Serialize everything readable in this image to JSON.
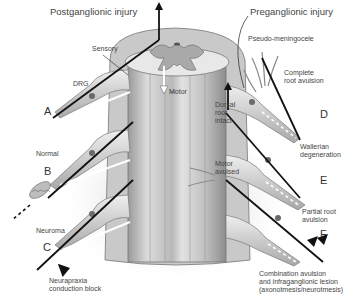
{
  "diagram": {
    "headings": {
      "left": "Postganglionic injury",
      "right": "Preganglionic injury"
    },
    "structure_labels": {
      "sensory": "Sensory",
      "drg": "DRG",
      "motor": "Motor",
      "pseudo_meningocele": "Pseudo-meningocele",
      "dorsal_root_intact": [
        "Dorsal",
        "root",
        "intact"
      ],
      "motor_avulsed": [
        "Motor",
        "avulsed"
      ]
    },
    "cases": [
      {
        "letter": "A",
        "side": "left",
        "description": [
          "Normal"
        ]
      },
      {
        "letter": "B",
        "side": "left",
        "description": [
          "Neuroma"
        ]
      },
      {
        "letter": "C",
        "side": "left",
        "description": [
          "Neurapraxia",
          "conduction block"
        ]
      },
      {
        "letter": "D",
        "side": "right",
        "description": [
          "Complete",
          "root avulsion"
        ]
      },
      {
        "letter": "E",
        "side": "right",
        "description": [
          "Wallerian",
          "degeneration"
        ]
      },
      {
        "letter": "F",
        "side": "right",
        "description": [
          "Partial root",
          "avulsion"
        ]
      }
    ],
    "footnote": [
      "Combination avulsion",
      "and infraganglionic lesion",
      "(axonotmesis/neurotmesis)"
    ],
    "icons": {
      "up-arrow": "↑",
      "arrowhead": "▶"
    },
    "colors": {
      "line": "#111111",
      "cord": "#cfcfcf",
      "cord_shadow": "#8a8a8a",
      "nerve": "#d9d9d9",
      "nerve_edge": "#7a7a7a"
    }
  }
}
